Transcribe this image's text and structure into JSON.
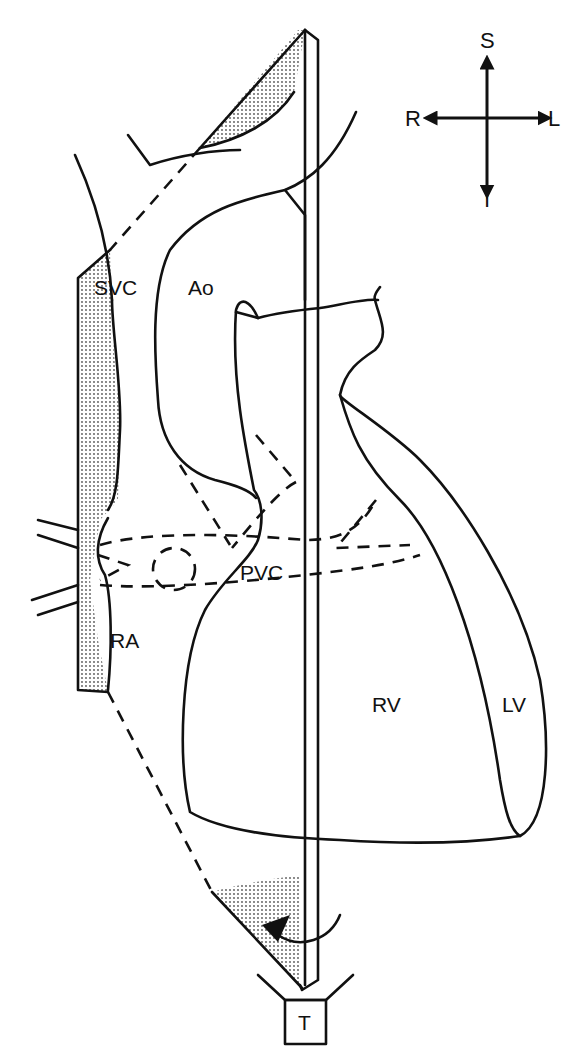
{
  "diagram": {
    "structures": [
      {
        "id": "svc",
        "label": "SVC"
      },
      {
        "id": "ao",
        "label": "Ao"
      },
      {
        "id": "pvc",
        "label": "PVC"
      },
      {
        "id": "ra",
        "label": "RA"
      },
      {
        "id": "rv",
        "label": "RV"
      },
      {
        "id": "lv",
        "label": "LV"
      }
    ],
    "compass": {
      "superior": "S",
      "inferior": "I",
      "right": "R",
      "left": "L"
    },
    "transducer": {
      "label": "T"
    },
    "colors": {
      "ink": "#111111",
      "background": "#ffffff",
      "stipple": "#bdbdbd"
    }
  }
}
